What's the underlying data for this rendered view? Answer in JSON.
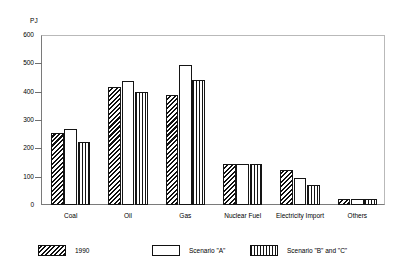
{
  "chart_data": {
    "type": "bar",
    "title": "",
    "subtitle": "",
    "xlabel": "",
    "ylabel": "PJ",
    "unit_label": "PJ",
    "ylim": [
      0,
      600
    ],
    "ytick_values": [
      0,
      100,
      200,
      300,
      400,
      500,
      600
    ],
    "ytick_labels": [
      "0",
      "100",
      "200",
      "300",
      "400",
      "500",
      "600"
    ],
    "grid": false,
    "legend_position": "bottom",
    "categories": [
      "Coal",
      "Oil",
      "Gas",
      "Nuclear Fuel",
      "Electricity Import",
      "Others"
    ],
    "series": [
      {
        "name": "1990",
        "pattern": "diagonal-hatch",
        "values": [
          255,
          418,
          388,
          143,
          122,
          20
        ]
      },
      {
        "name": "Scenario \"A\"",
        "pattern": "dotted",
        "values": [
          270,
          437,
          495,
          143,
          97,
          22
        ]
      },
      {
        "name": "Scenario \"B\" and \"C\"",
        "pattern": "vertical-lines",
        "values": [
          222,
          400,
          440,
          143,
          72,
          22
        ]
      }
    ]
  },
  "axis": {
    "unit": "PJ",
    "ticks": [
      "600",
      "500",
      "400",
      "300",
      "200",
      "100",
      "0"
    ]
  },
  "legend": {
    "items": [
      {
        "label": "1990"
      },
      {
        "label": "Scenario \"A\""
      },
      {
        "label": "Scenario \"B\" and \"C\""
      }
    ]
  },
  "colors": {
    "background": "#ffffff",
    "ink": "#000000",
    "axis": "#6f6f6f",
    "frame_light": "#b9b9b9"
  }
}
